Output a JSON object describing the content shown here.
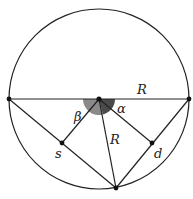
{
  "figure": {
    "labels": {
      "radius_top": "R",
      "radius_inner": "R",
      "beta": "β",
      "alpha": "α",
      "s": "s",
      "d": "d"
    },
    "colors": {
      "stroke": "#222222",
      "beta_wedge": "#8a8a8a",
      "alpha_wedge": "#4a4a4a",
      "background": "#ffffff"
    }
  }
}
